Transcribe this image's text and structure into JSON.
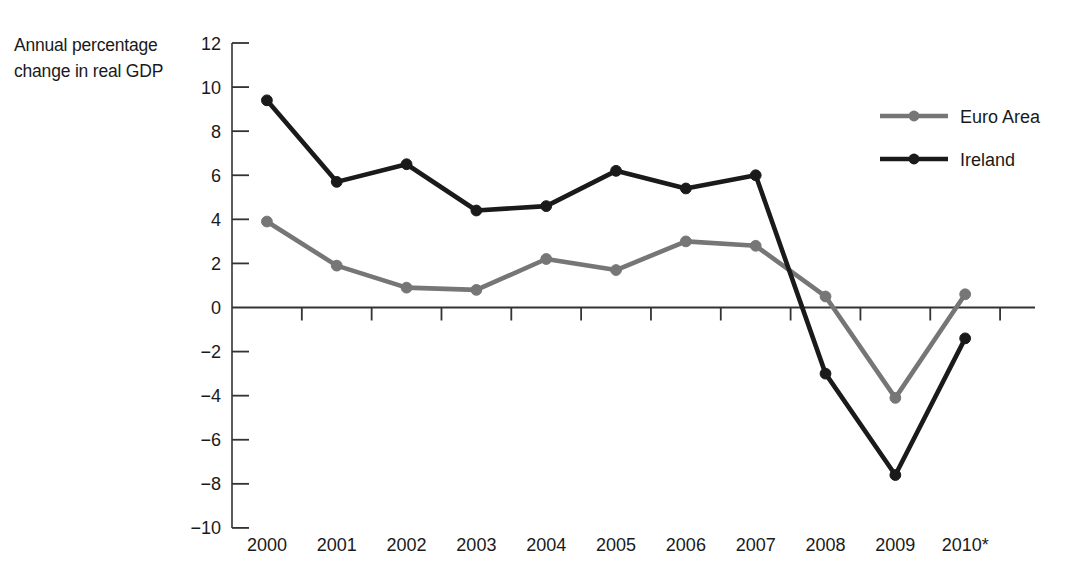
{
  "chart_data": {
    "type": "line",
    "title": "",
    "subtitle": "",
    "xlabel": "",
    "ylabel": "Annual percentage change in real GDP",
    "ylabel_line1": "Annual percentage",
    "ylabel_line2": "change in real GDP",
    "categories": [
      "2000",
      "2001",
      "2002",
      "2003",
      "2004",
      "2005",
      "2006",
      "2007",
      "2008",
      "2009",
      "2010*"
    ],
    "x_tick_labels": [
      "2000",
      "2001",
      "2002",
      "2003",
      "2004",
      "2005",
      "2006",
      "2007",
      "2008",
      "2009",
      "2010*"
    ],
    "y_tick_labels": [
      "12",
      "10",
      "8",
      "6",
      "4",
      "2",
      "0",
      "−2",
      "−4",
      "−6",
      "−8",
      "−10"
    ],
    "y_tick_values": [
      12,
      10,
      8,
      6,
      4,
      2,
      0,
      -2,
      -4,
      -6,
      -8,
      -10
    ],
    "ylim": [
      -10,
      12
    ],
    "y_step": 2,
    "grid": false,
    "zero_line": true,
    "legend_position": "top-right",
    "series": [
      {
        "name": "Euro Area",
        "color": "#767676",
        "values": [
          3.9,
          1.9,
          0.9,
          0.8,
          2.2,
          1.7,
          3.0,
          2.8,
          0.5,
          -4.1,
          0.6
        ]
      },
      {
        "name": "Ireland",
        "color": "#1a1a1a",
        "values": [
          9.4,
          5.7,
          6.5,
          4.4,
          4.6,
          6.2,
          5.4,
          6.0,
          -3.0,
          -7.6,
          -1.4
        ]
      }
    ]
  },
  "legend": {
    "items": [
      {
        "label": "Euro Area",
        "color": "#767676"
      },
      {
        "label": "Ireland",
        "color": "#1a1a1a"
      }
    ]
  },
  "colors": {
    "euro_area": "#767676",
    "ireland": "#1a1a1a",
    "axis": "#333333",
    "background": "#ffffff"
  }
}
